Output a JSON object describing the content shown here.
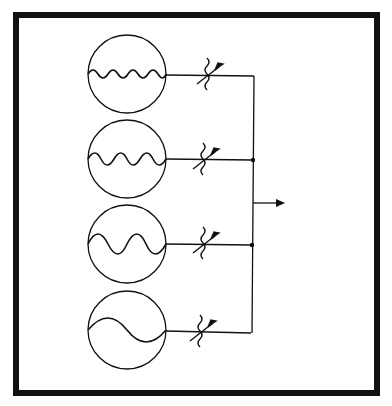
{
  "diagram": {
    "type": "circuit-schematic",
    "colors": {
      "ink": "#111111",
      "background": "#ffffff",
      "frame": "#111111"
    },
    "sources": [
      {
        "id": "source-1",
        "waveform": "sine",
        "cycles": 4,
        "amplitude": "small",
        "resistor": "variable-resistor"
      },
      {
        "id": "source-2",
        "waveform": "sine",
        "cycles": 3,
        "amplitude": "medium",
        "resistor": "variable-resistor"
      },
      {
        "id": "source-3",
        "waveform": "sine",
        "cycles": 2,
        "amplitude": "large",
        "resistor": "variable-resistor"
      },
      {
        "id": "source-4",
        "waveform": "sine",
        "cycles": 1,
        "amplitude": "medium",
        "resistor": "variable-resistor"
      }
    ],
    "bus": {
      "junctions": 2,
      "output": "output-arrow"
    }
  }
}
